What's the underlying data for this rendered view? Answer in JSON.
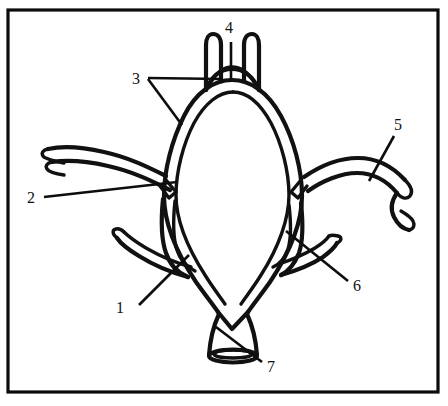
{
  "figure": {
    "background_color": "#ffffff",
    "line_color": "#111111",
    "frame_color": "#0b0b0b",
    "frame": {
      "x": 8,
      "y": 10,
      "width": 430,
      "height": 382
    }
  },
  "labels": [
    {
      "id": "label-1",
      "text": "1",
      "x": 120,
      "y": 313,
      "leader": "M 139 305 L 188 256",
      "points_to": "left-inferior-branch-junction"
    },
    {
      "id": "label-2",
      "text": "2",
      "x": 31,
      "y": 203,
      "leader": "M 44 197 L 175 182",
      "points_to": "left-middle-stub-junction"
    },
    {
      "id": "label-3",
      "text": "3",
      "x": 136,
      "y": 82,
      "leader_a": "M 147 77 L 222 79",
      "leader_b": "M 147 79 L 181 124",
      "points_to": "upper-left-vessel-and-left-ring-wall"
    },
    {
      "id": "label-4",
      "text": "4",
      "x": 226,
      "y": 33,
      "leader": "M 231 41 L 231 78",
      "points_to": "top-arch-communicating-segment"
    },
    {
      "id": "label-5",
      "text": "5",
      "x": 395,
      "y": 129,
      "leader": "M 393 135 L 369 180",
      "points_to": "right-lateral-vessel"
    },
    {
      "id": "label-6",
      "text": "6",
      "x": 355,
      "y": 290,
      "leader": "M 349 282 L 286 231",
      "points_to": "right-inferior-branch-junction"
    },
    {
      "id": "label-7",
      "text": "7",
      "x": 268,
      "y": 371,
      "leader": "M 262 363 L 216 327",
      "points_to": "inferior-trunk-cut-end"
    }
  ],
  "vessels": {
    "ring_left_wall": "M 232 80 C 214 80 196 92 184 116 C 172 140 164 170 164 196 C 164 222 176 252 196 282 C 206 296 214 306 218 312",
    "ring_right_wall": "M 232 80 C 250 80 268 92 281 116 C 294 140 302 170 302 196 C 302 222 290 252 270 282 C 260 296 252 306 248 312",
    "ring_left_inner": "M 233 89 C 218 89 203 100 192 121 C 181 143 174 171 174 195 C 174 219 186 248 204 276 C 212 289 220 299 224 305",
    "ring_right_inner": "M 233 89 C 248 89 262 100 273 121 C 284 143 291 171 291 195 C 291 219 280 248 262 276 C 254 289 246 299 242 305",
    "top_arch_outer": "M 206 88 C 212 74 222 68 232 68 C 242 68 252 74 259 88",
    "top_arch_inner": "M 211 80 C 216 72 224 67 232 67 C 241 67 249 72 254 80",
    "upper_left_stem_outer": "M 206 88 L 206 42 C 206 36 210 33 214 33 C 218 33 221 37 221 42 L 221 78",
    "upper_right_stem_outer": "M 259 88 L 259 42 C 259 36 255 33 251 33 C 247 33 244 37 244 42 L 244 78",
    "left_lateral_upper_outer": "M 166 176 C 150 168 128 158 104 153 C 82 148 62 147 48 150",
    "left_lateral_upper_inner": "M 168 188 C 152 180 130 170 106 165 C 84 160 64 159 50 161",
    "left_fork_upper": "M 48 150 L 44 152 C 41 154 41 157 44 159 L 62 163",
    "left_fork_lower": "M 50 161 L 45 163 C 42 165 42 168 45 170 L 60 173",
    "left_stub_end": "M 166 180 L 174 190 L 168 196 L 160 186 Z",
    "left_lower_branch_outer": "M 162 200 C 160 218 160 238 164 252 C 168 264 176 272 186 276",
    "left_lower_branch_inner": "M 173 202 C 171 220 171 238 174 250 C 177 260 184 267 192 270",
    "left_hook_outer": "M 186 276 C 172 272 154 266 138 256 C 128 250 120 244 116 238",
    "left_hook_inner": "M 188 266 C 174 262 158 256 144 248 C 134 242 126 236 122 232",
    "left_hook_cap": "M 116 238 C 112 234 112 230 116 229 C 120 228 122 230 122 232",
    "right_stub_end": "M 300 180 L 292 190 L 298 196 L 306 186 Z",
    "right_lateral_upper_outer": "M 304 178 C 320 168 340 160 358 160 C 376 160 392 168 404 180",
    "right_lateral_upper_inner": "M 306 190 C 320 180 340 172 356 172 C 372 172 386 180 396 192",
    "right_fork_upper": "M 404 180 C 410 186 412 192 409 196 C 406 200 400 198 396 192",
    "right_fork_lower": "M 396 192 C 392 198 390 208 394 216 C 398 224 404 228 408 228",
    "right_fork_tip": "M 408 228 C 412 228 414 224 412 220 C 410 216 406 214 402 212",
    "right_lower_branch_outer": "M 300 204 C 302 222 302 240 298 252 C 294 262 288 270 280 274",
    "right_lower_branch_inner": "M 289 206 C 291 222 291 238 288 248 C 285 257 280 263 273 266",
    "right_hook_outer": "M 280 274 C 294 270 310 264 322 256 C 330 250 334 246 336 242",
    "right_hook_inner": "M 278 264 C 290 260 304 254 314 248 C 322 243 326 239 328 236",
    "right_hook_cap": "M 336 242 C 340 240 340 236 336 235 C 332 234 330 235 328 236",
    "apex_v": "M 218 312 L 232 328 L 248 312",
    "trunk_left": "M 219 314 C 214 326 210 340 209 354",
    "trunk_right": "M 247 314 C 252 326 256 340 257 354",
    "trunk_end_ellipse": {
      "cx": 233,
      "cy": 356,
      "rx": 24,
      "ry": 6
    },
    "trunk_end_inner": {
      "cx": 233,
      "cy": 354,
      "rx": 20,
      "ry": 4
    }
  }
}
